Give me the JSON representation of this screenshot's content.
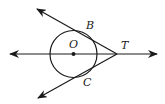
{
  "diagram": {
    "type": "geometry",
    "colors": {
      "stroke": "#1a1a1a",
      "background": "#ffffff"
    },
    "points": {
      "O": {
        "label": "O",
        "x": 73.5,
        "y": 54
      },
      "T": {
        "label": "T",
        "x": 117,
        "y": 54
      },
      "B": {
        "label": "B",
        "x": 86,
        "y": 34
      },
      "C": {
        "label": "C",
        "x": 84,
        "y": 75
      }
    },
    "circle": {
      "center": "O",
      "cx": 73.5,
      "cy": 54,
      "r": 23.5
    },
    "lines": [
      {
        "name": "line-OT",
        "from": [
          10,
          54
        ],
        "to": [
          157,
          54
        ],
        "arrows": "both"
      },
      {
        "name": "ray-TB",
        "from": [
          117,
          54
        ],
        "to": [
          37,
          9
        ],
        "arrows": "end"
      },
      {
        "name": "ray-TC",
        "from": [
          117,
          54
        ],
        "to": [
          38,
          98
        ],
        "arrows": "end"
      }
    ],
    "labels": {
      "B": "B",
      "C": "C",
      "O": "O",
      "T": "T"
    }
  }
}
